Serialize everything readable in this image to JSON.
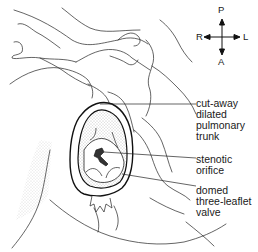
{
  "figure": {
    "type": "anatomical line drawing"
  },
  "orientation": {
    "top": "P",
    "right": "L",
    "bottom": "A",
    "left": "R"
  },
  "labels": [
    {
      "id": "trunk",
      "text": "cut-away\ndilated\npulmonary\ntrunk"
    },
    {
      "id": "orifice",
      "text": "stenotic\norifice"
    },
    {
      "id": "valve",
      "text": "domed\nthree-leaflet\nvalve"
    }
  ],
  "colors": {
    "ink": "#1a1a1a",
    "background": "#ffffff",
    "stipple": "#8a8a8a"
  }
}
